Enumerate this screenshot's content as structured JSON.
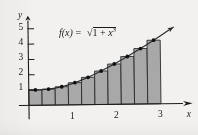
{
  "figure": {
    "name": "midpoint-riemann-sum-figure",
    "background_color": "#f2f1ef",
    "ink_color": "#1b1b1b",
    "rect_fill_color": "#a8a8a8",
    "rect_stroke_color": "#2a2a2a"
  },
  "formula": {
    "fx": "f(x)",
    "equals": "=",
    "radical": "√",
    "radicand_one": "1",
    "plus": "+",
    "radicand_x": "x",
    "exponent": "3",
    "full_text": "f(x) = √(1 + x³)"
  },
  "axes": {
    "x_label": "x",
    "y_label": "y",
    "x_ticks": [
      {
        "value": 1,
        "label": "1"
      },
      {
        "value": 2,
        "label": "2"
      },
      {
        "value": 3,
        "label": "3"
      }
    ],
    "y_ticks": [
      {
        "value": 1,
        "label": "1"
      },
      {
        "value": 2,
        "label": "2"
      },
      {
        "value": 3,
        "label": "3"
      },
      {
        "value": 4,
        "label": "4"
      },
      {
        "value": 5,
        "label": "5"
      }
    ],
    "x_arrow": true,
    "y_arrow": true
  },
  "chart_data": {
    "type": "area",
    "title": "",
    "subtitle": "",
    "xlabel": "x",
    "ylabel": "y",
    "xlim": [
      0,
      3.35
    ],
    "ylim": [
      0,
      5.9
    ],
    "grid": false,
    "legend": null,
    "annotations": [
      {
        "text": "f(x) = √(1 + x³)",
        "x": 1.0,
        "y": 5.05
      }
    ],
    "series": [
      {
        "name": "f(x) = sqrt(1 + x^3)",
        "type": "line",
        "style": "smooth-curve-with-arrowhead",
        "x": [
          0,
          0.15,
          0.3,
          0.45,
          0.6,
          0.75,
          0.9,
          1.05,
          1.2,
          1.35,
          1.5,
          1.65,
          1.8,
          1.95,
          2.1,
          2.25,
          2.4,
          2.55,
          2.7,
          2.85,
          3.0,
          3.15,
          3.3
        ],
        "y": [
          1.0,
          1.0017,
          1.0134,
          1.0448,
          1.1027,
          1.1896,
          1.3045,
          1.4446,
          1.6062,
          1.7857,
          1.9803,
          2.1876,
          2.406,
          2.634,
          2.8706,
          3.1151,
          3.3665,
          3.6245,
          3.8884,
          4.1579,
          4.4326,
          4.7121,
          4.9961
        ]
      },
      {
        "name": "midpoint rectangles",
        "type": "bar",
        "n": 10,
        "interval": [
          0,
          3
        ],
        "width": 0.3,
        "rule": "midpoint",
        "midpoints": [
          0.15,
          0.45,
          0.75,
          1.05,
          1.35,
          1.65,
          1.95,
          2.25,
          2.55,
          2.85
        ],
        "heights": [
          1.0017,
          1.0448,
          1.1896,
          1.4446,
          1.7857,
          2.1876,
          2.634,
          3.1151,
          3.6245,
          4.1579
        ]
      },
      {
        "name": "midpoint sample dots",
        "type": "scatter",
        "x": [
          0.15,
          0.45,
          0.75,
          1.05,
          1.35,
          1.65,
          1.95,
          2.25,
          2.55,
          2.85
        ],
        "y": [
          1.0017,
          1.0448,
          1.1896,
          1.4446,
          1.7857,
          2.1876,
          2.634,
          3.1151,
          3.6245,
          4.1579
        ]
      }
    ]
  }
}
